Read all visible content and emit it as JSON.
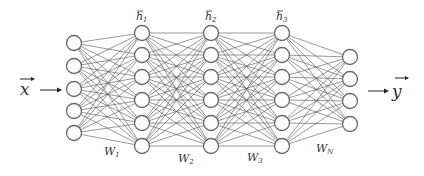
{
  "diagram": {
    "type": "feedforward-neural-network",
    "input_label": "x",
    "output_label": "y",
    "layers": [
      {
        "name": "input",
        "label": "",
        "x": 74,
        "nodes_y": [
          43,
          66,
          89,
          111,
          133
        ]
      },
      {
        "name": "hidden1",
        "label": "h",
        "sub": "1",
        "x": 142,
        "nodes_y": [
          33,
          55,
          77,
          100,
          123,
          146
        ]
      },
      {
        "name": "hidden2",
        "label": "h",
        "sub": "2",
        "x": 211,
        "nodes_y": [
          33,
          55,
          77,
          100,
          123,
          146
        ]
      },
      {
        "name": "hidden3",
        "label": "h",
        "sub": "3",
        "x": 282,
        "nodes_y": [
          33,
          55,
          77,
          100,
          123,
          146
        ]
      },
      {
        "name": "output",
        "label": "",
        "x": 350,
        "nodes_y": [
          57,
          79,
          101,
          124
        ]
      }
    ],
    "weights": [
      {
        "label": "W",
        "sub": "1",
        "x": 104,
        "y": 155
      },
      {
        "label": "W",
        "sub": "2",
        "x": 178,
        "y": 162
      },
      {
        "label": "W",
        "sub": "3",
        "x": 247,
        "y": 161
      },
      {
        "label": "W",
        "sub": "N",
        "x": 316,
        "y": 152
      }
    ],
    "colors": {
      "edge": "#555555",
      "node_stroke": "#6a6a6a",
      "text": "#333333"
    }
  }
}
